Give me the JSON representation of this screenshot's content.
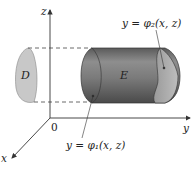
{
  "diagram": {
    "type": "3d-region-type-2",
    "axes": {
      "z_label": "z",
      "y_label": "y",
      "x_label": "x",
      "origin_label": "0"
    },
    "region_D_label": "D",
    "solid_E_label": "E",
    "surface_back_label": "y = φ₂(x, z)",
    "surface_front_label": "y = φ₁(x, z)",
    "colors": {
      "cylinder_fill": "#7a7a7a",
      "cylinder_dark": "#4f4f4f",
      "cylinder_light": "#a9a9a9",
      "region_D_fill": "#c8c8c8",
      "axis": "#333333"
    }
  }
}
